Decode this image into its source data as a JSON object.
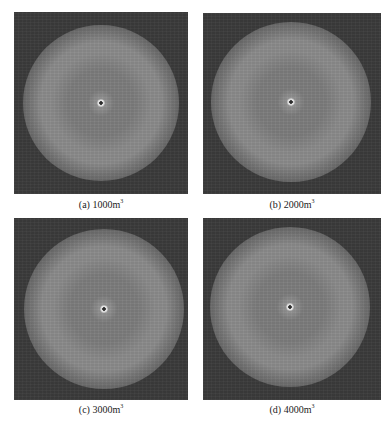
{
  "figure": {
    "panels": [
      {
        "id": "a",
        "label_prefix": "(a) 1000m",
        "label_superscript": "3",
        "volume": "1000m³"
      },
      {
        "id": "b",
        "label_prefix": "(b) 2000m",
        "label_superscript": "3",
        "volume": "2000m³"
      },
      {
        "id": "c",
        "label_prefix": "(c) 3000m",
        "label_superscript": "3",
        "volume": "3000m³"
      },
      {
        "id": "d",
        "label_prefix": "(d) 4000m",
        "label_superscript": "3",
        "volume": "4000m³"
      }
    ],
    "colors": {
      "background": "#3c3c3c",
      "ring": "#8c8c8c",
      "inner": "#7e7e7e",
      "core": "#e8e8e8"
    }
  }
}
